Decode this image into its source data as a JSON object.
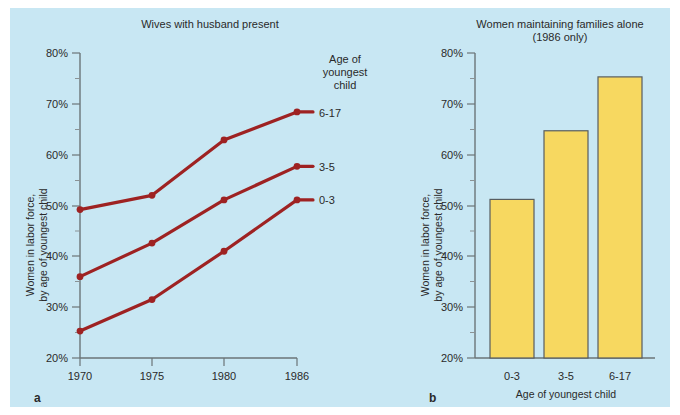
{
  "figure": {
    "background_color": "#c8e7f3",
    "line_color": "#9e2222",
    "bar_fill_color": "#f7d860",
    "bar_border_color": "#585d60",
    "axis_color": "#6b7577"
  },
  "panel_a": {
    "letter": "a",
    "title": "Wives with husband present",
    "ylabel_line1": "Women in labor force,",
    "ylabel_line2": "by age of youngest child",
    "legend_title_line1": "Age of",
    "legend_title_line2": "youngest",
    "legend_title_line3": "child",
    "yticks": [
      "20%",
      "30%",
      "40%",
      "50%",
      "60%",
      "70%",
      "80%"
    ],
    "xticks": [
      "1970",
      "1975",
      "1980",
      "1986"
    ]
  },
  "panel_b": {
    "letter": "b",
    "title_line1": "Women maintaining families alone",
    "title_line2": "(1986 only)",
    "ylabel_line1": "Women in labor force,",
    "ylabel_line2": "by age of youngest child",
    "xlabel": "Age of youngest child",
    "yticks": [
      "20%",
      "30%",
      "40%",
      "50%",
      "60%",
      "70%",
      "80%"
    ],
    "xticks": [
      "0-3",
      "3-5",
      "6-17"
    ]
  },
  "chart_data": [
    {
      "type": "line",
      "title": "Wives with husband present",
      "xlabel": "",
      "ylabel": "Women in labor force, by age of youngest child",
      "x": [
        1970,
        1975,
        1980,
        1986
      ],
      "xtick_labels": [
        "1970",
        "1975",
        "1980",
        "1986"
      ],
      "ylim": [
        20,
        80
      ],
      "ytick_values": [
        20,
        30,
        40,
        50,
        60,
        70,
        80
      ],
      "ytick_labels": [
        "20%",
        "30%",
        "40%",
        "50%",
        "60%",
        "70%",
        "80%"
      ],
      "grid": false,
      "legend_position": "right",
      "legend_title": "Age of youngest child",
      "series": [
        {
          "name": "6-17",
          "values": [
            49.2,
            52.0,
            62.9,
            68.4
          ],
          "color": "#9e2222"
        },
        {
          "name": "3-5",
          "values": [
            36.0,
            42.6,
            51.1,
            57.7
          ],
          "color": "#9e2222"
        },
        {
          "name": "0-3",
          "values": [
            25.3,
            31.5,
            41.0,
            51.1
          ],
          "color": "#9e2222"
        }
      ]
    },
    {
      "type": "bar",
      "title": "Women maintaining families alone (1986 only)",
      "xlabel": "Age of youngest child",
      "ylabel": "Women in labor force, by age of youngest child",
      "categories": [
        "0-3",
        "3-5",
        "6-17"
      ],
      "values": [
        51.2,
        64.7,
        75.3
      ],
      "ylim": [
        20,
        80
      ],
      "ytick_values": [
        20,
        30,
        40,
        50,
        60,
        70,
        80
      ],
      "ytick_labels": [
        "20%",
        "30%",
        "40%",
        "50%",
        "60%",
        "70%",
        "80%"
      ],
      "grid": false,
      "legend_position": "none",
      "bar_color": "#f7d860"
    }
  ]
}
